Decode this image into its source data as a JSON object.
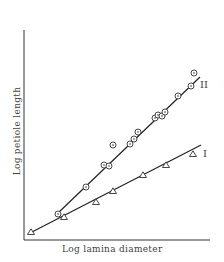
{
  "chart_data": {
    "type": "scatter",
    "title": "",
    "xlabel": "Log lamina diameter",
    "ylabel": "Log petiole length",
    "grid": false,
    "ticks": false,
    "series": [
      {
        "name": "I",
        "marker": "triangle",
        "fit": "line",
        "points_px": [
          [
            31,
            232
          ],
          [
            64,
            217
          ],
          [
            96,
            202
          ],
          [
            113,
            191
          ],
          [
            143,
            175
          ],
          [
            166,
            165
          ],
          [
            193,
            154
          ]
        ],
        "line_px": [
          [
            30,
            233
          ],
          [
            201,
            145
          ]
        ]
      },
      {
        "name": "II",
        "marker": "circle-dot",
        "fit": "line",
        "points_px": [
          [
            58,
            214
          ],
          [
            86,
            187
          ],
          [
            104,
            165
          ],
          [
            109,
            166
          ],
          [
            113,
            145
          ],
          [
            130,
            144
          ],
          [
            134,
            139
          ],
          [
            138,
            132
          ],
          [
            155,
            118
          ],
          [
            158,
            115
          ],
          [
            162,
            116
          ],
          [
            165,
            112
          ],
          [
            178,
            96
          ],
          [
            191,
            86
          ],
          [
            194,
            73
          ]
        ],
        "line_px": [
          [
            58,
            213
          ],
          [
            200,
            77
          ]
        ]
      }
    ]
  },
  "labels": {
    "xlabel": "Log lamina diameter",
    "ylabel": "Log petiole length",
    "series_I": "I",
    "series_II": "II"
  }
}
